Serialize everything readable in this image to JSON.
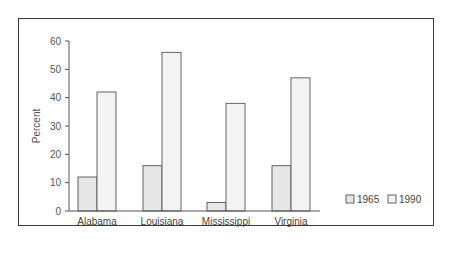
{
  "chart_data": {
    "type": "bar",
    "title": "",
    "xlabel": "",
    "ylabel": "Percent",
    "ylim": [
      0,
      60
    ],
    "yticks": [
      0,
      10,
      20,
      30,
      40,
      50,
      60
    ],
    "grid": false,
    "legend_position": "right-bottom",
    "categories": [
      "Alabama",
      "Louisiana",
      "Mississippi",
      "Virginia"
    ],
    "series": [
      {
        "name": "1965",
        "values": [
          12,
          16,
          3,
          16
        ],
        "color": "#e6e6e6"
      },
      {
        "name": "1990",
        "values": [
          42,
          56,
          38,
          47
        ],
        "color": "#f3f3f3"
      }
    ]
  },
  "colors": {
    "frame": "#3a3a3a",
    "axis": "#555555",
    "bar_outline": "#555555"
  }
}
